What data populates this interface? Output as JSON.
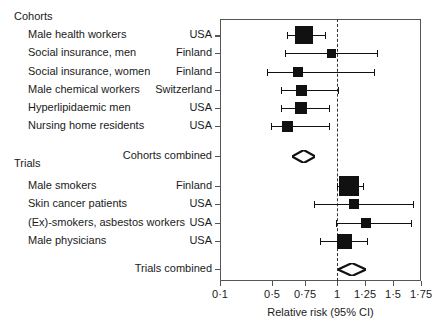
{
  "chart_data": {
    "type": "scatter",
    "chart_subtype": "forest-plot",
    "title": "",
    "xlabel": "Relative risk (95% CI)",
    "ylabel": "",
    "xscale": "log",
    "xlim": [
      0.1,
      1.75
    ],
    "grid": false,
    "null_value": 1,
    "null_line_style": "dotted",
    "xticks": [
      0.1,
      0.5,
      0.75,
      1,
      1.25,
      1.5,
      1.75
    ],
    "xtick_labels": [
      "0·1",
      "0·5",
      "0·75",
      "1",
      "1·25",
      "1·5",
      "1·75"
    ],
    "groups": [
      {
        "name": "Cohorts",
        "studies": [
          {
            "label": "Male health workers",
            "country": "USA",
            "rr": 0.74,
            "ci_low": 0.61,
            "ci_high": 0.91,
            "marker_size": 18
          },
          {
            "label": "Social insurance, men",
            "country": "Finland",
            "rr": 0.96,
            "ci_low": 0.6,
            "ci_high": 1.36,
            "marker_size": 9
          },
          {
            "label": "Social insurance, women",
            "country": "Finland",
            "rr": 0.7,
            "ci_low": 0.46,
            "ci_high": 1.33,
            "marker_size": 10
          },
          {
            "label": "Male chemical workers",
            "country": "Switzerland",
            "rr": 0.72,
            "ci_low": 0.57,
            "ci_high": 1.01,
            "marker_size": 11
          },
          {
            "label": "Hyperlipidaemic men",
            "country": "USA",
            "rr": 0.72,
            "ci_low": 0.57,
            "ci_high": 0.94,
            "marker_size": 12
          },
          {
            "label": "Nursing home residents",
            "country": "USA",
            "rr": 0.62,
            "ci_low": 0.49,
            "ci_high": 0.94,
            "marker_size": 11
          }
        ],
        "summary": {
          "label": "Cohorts combined",
          "rr": 0.73,
          "ci_low": 0.65,
          "ci_high": 0.83
        }
      },
      {
        "name": "Trials",
        "studies": [
          {
            "label": "Male smokers",
            "country": "Finland",
            "rr": 1.11,
            "ci_low": 1.0,
            "ci_high": 1.23,
            "marker_size": 20
          },
          {
            "label": "Skin cancer patients",
            "country": "USA",
            "rr": 1.15,
            "ci_low": 0.82,
            "ci_high": 1.68,
            "marker_size": 10
          },
          {
            "label": "(Ex)-smokers, asbestos workers",
            "country": "USA",
            "rr": 1.26,
            "ci_low": 0.99,
            "ci_high": 1.66,
            "marker_size": 10
          },
          {
            "label": "Male physicians",
            "country": "USA",
            "rr": 1.07,
            "ci_low": 0.87,
            "ci_high": 1.27,
            "marker_size": 15
          }
        ],
        "summary": {
          "label": "Trials combined",
          "rr": 1.15,
          "ci_low": 1.01,
          "ci_high": 1.26
        }
      }
    ]
  },
  "axis": {
    "title": "Relative risk (95% CI)"
  },
  "colors": {
    "marker": "#111111",
    "frame": "#555555",
    "null_line": "#333333",
    "text": "#1a1a1a",
    "background": "#ffffff"
  }
}
